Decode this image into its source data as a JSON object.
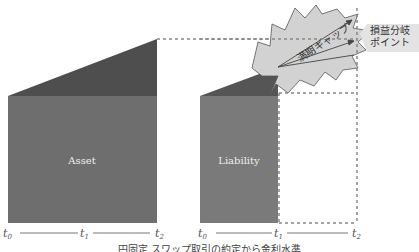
{
  "diagram": {
    "left_panel": {
      "label": "Asset",
      "time_axis": [
        "t0",
        "t1",
        "t2"
      ],
      "colors": {
        "body": "#6e6e6e",
        "wedge": "#4e4e4e"
      }
    },
    "right_panel": {
      "label": "Liability",
      "time_axis": [
        "t0",
        "t1",
        "t2"
      ],
      "colors": {
        "body": "#7a7a7a",
        "wedge": "#555555",
        "burst": "#cfcfcf"
      }
    },
    "burst_label": "満期ギャップ",
    "callout_label_line1": "損益分岐",
    "callout_label_line2": "ポイント",
    "caption": "円固定 スワップ取引の約定から金利水準"
  }
}
